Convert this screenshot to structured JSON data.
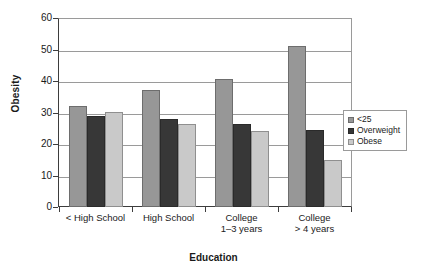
{
  "chart_data": {
    "type": "bar",
    "title": "",
    "xlabel": "Education",
    "ylabel": "Obesity",
    "categories": [
      "< High School",
      "High School",
      "College 1–3 years",
      "College > 4 years"
    ],
    "category_lines": [
      [
        "< High School",
        ""
      ],
      [
        "High School",
        ""
      ],
      [
        "College",
        "1–3 years"
      ],
      [
        "College",
        "> 4 years"
      ]
    ],
    "series": [
      {
        "name": "<25",
        "color": "#979797",
        "values": [
          32.0,
          37.0,
          40.5,
          51.0
        ]
      },
      {
        "name": "Overweight",
        "color": "#373737",
        "values": [
          29.0,
          28.0,
          26.5,
          24.5
        ]
      },
      {
        "name": "Obese",
        "color": "#c9c9c9",
        "values": [
          30.3,
          26.5,
          24.0,
          15.0
        ]
      }
    ],
    "ylim": [
      0,
      60
    ],
    "yticks": [
      0,
      10,
      20,
      30,
      40,
      50,
      60
    ],
    "ytick_labels": [
      "0",
      "10",
      "20",
      "30",
      "40",
      "50",
      "60"
    ],
    "grid": true,
    "grid_axis": "y",
    "legend_position": "right",
    "legend_entries": [
      "<25",
      "Overweight",
      "Obese"
    ]
  },
  "axis": {
    "y_title": "Obesity",
    "x_title": "Education"
  }
}
